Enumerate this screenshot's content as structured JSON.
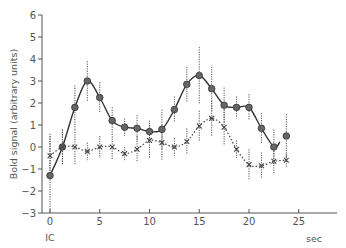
{
  "chart_data": {
    "type": "line",
    "title": "",
    "xlabel": "sec",
    "ylabel": "Bold signal (arbitrary units)",
    "x_origin_label": "IC",
    "xlim": [
      0,
      29
    ],
    "ylim": [
      -3,
      6
    ],
    "x_ticks": [
      0,
      5,
      10,
      15,
      20,
      25
    ],
    "y_ticks": [
      -3,
      -2,
      -1,
      0,
      1,
      2,
      3,
      4,
      5,
      6
    ],
    "grid": false,
    "legend": null,
    "x": [
      0,
      1.25,
      2.5,
      3.75,
      5,
      6.25,
      7.5,
      8.75,
      10,
      11.25,
      12.5,
      13.75,
      15,
      16.25,
      17.5,
      18.75,
      20,
      21.25,
      22.5,
      23.75
    ],
    "series": [
      {
        "name": "solid (filled circles)",
        "marker": "circle",
        "line": "solid",
        "values": [
          -1.3,
          0.0,
          1.8,
          3.0,
          2.25,
          1.2,
          0.9,
          0.85,
          0.7,
          0.8,
          1.7,
          2.85,
          3.25,
          2.65,
          1.9,
          1.8,
          1.8,
          0.85,
          0.0,
          0.5
        ],
        "errors": [
          1.9,
          0.8,
          1.0,
          0.9,
          0.7,
          0.6,
          0.4,
          0.6,
          0.5,
          0.9,
          0.6,
          0.8,
          1.3,
          1.0,
          0.8,
          0.5,
          0.6,
          0.7,
          0.8,
          1.0
        ]
      },
      {
        "name": "dotted (crosses)",
        "marker": "x",
        "line": "dotted",
        "values": [
          -0.4,
          0.0,
          0.0,
          -0.2,
          0.0,
          0.0,
          -0.3,
          -0.1,
          0.3,
          0.2,
          0.0,
          0.25,
          0.95,
          1.3,
          0.9,
          -0.1,
          -0.8,
          -0.85,
          -0.65,
          -0.6
        ],
        "errors": [
          0.9,
          0.8,
          0.8,
          0.4,
          0.5,
          0.6,
          0.3,
          0.6,
          0.8,
          0.8,
          0.4,
          0.6,
          0.7,
          0.8,
          0.8,
          0.4,
          0.7,
          0.6,
          0.6,
          0.3
        ]
      }
    ]
  }
}
